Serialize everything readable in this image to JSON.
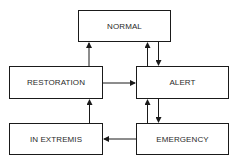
{
  "diagram": {
    "type": "state-transition",
    "states": [
      {
        "id": "normal",
        "label": "NORMAL"
      },
      {
        "id": "restoration",
        "label": "RESTORATION"
      },
      {
        "id": "alert",
        "label": "ALERT"
      },
      {
        "id": "in_extremis",
        "label": "IN EXTREMIS"
      },
      {
        "id": "emergency",
        "label": "EMERGENCY"
      }
    ],
    "transitions": [
      {
        "from": "restoration",
        "to": "normal"
      },
      {
        "from": "alert",
        "to": "normal"
      },
      {
        "from": "normal",
        "to": "alert"
      },
      {
        "from": "restoration",
        "to": "alert"
      },
      {
        "from": "emergency",
        "to": "alert"
      },
      {
        "from": "alert",
        "to": "emergency"
      },
      {
        "from": "in_extremis",
        "to": "restoration"
      },
      {
        "from": "emergency",
        "to": "in_extremis"
      }
    ],
    "colors": {
      "stroke": "#1a1a1a",
      "text": "#2a2a2a",
      "background": "#ffffff"
    }
  }
}
